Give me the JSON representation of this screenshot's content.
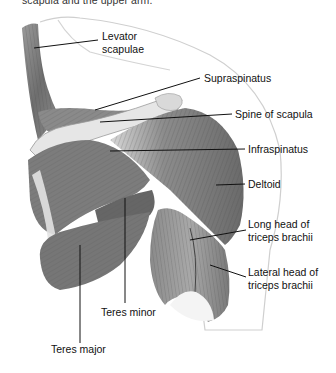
{
  "caption": "scapula and the upper arm.",
  "diagram": {
    "labels": [
      {
        "id": "levator",
        "line1": "Levator",
        "line2": "scapulae"
      },
      {
        "id": "supraspinatus",
        "line1": "Supraspinatus"
      },
      {
        "id": "spine",
        "line1": "Spine of scapula"
      },
      {
        "id": "infraspinatus",
        "line1": "Infraspinatus"
      },
      {
        "id": "deltoid",
        "line1": "Deltoid"
      },
      {
        "id": "long-head",
        "line1": "Long head of",
        "line2": "triceps brachii"
      },
      {
        "id": "lateral-head",
        "line1": "Lateral head of",
        "line2": "triceps brachii"
      },
      {
        "id": "teres-minor",
        "line1": "Teres minor"
      },
      {
        "id": "teres-major",
        "line1": "Teres major"
      }
    ]
  }
}
